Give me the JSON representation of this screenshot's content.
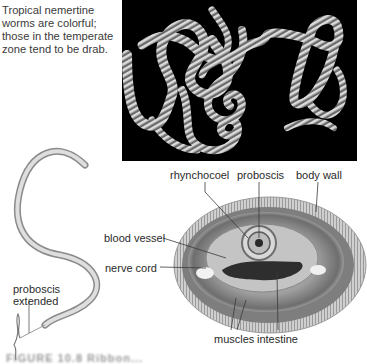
{
  "caption_top": "Tropical nemertine worms are colorful; those in the temperate zone tend to be drab.",
  "photo": {
    "description": "striped nemertine worms coiled on black background",
    "background": "#000000",
    "stripe_light": "#d8d8d8",
    "stripe_dark": "#6a6a6a"
  },
  "worm_drawing": {
    "labels": {
      "proboscis_extended": [
        "proboscis",
        "extended"
      ]
    }
  },
  "cross_section": {
    "labels": {
      "rhynchocoel": "rhynchocoel",
      "proboscis": "proboscis",
      "body_wall": "body wall",
      "blood_vessel": "blood vessel",
      "nerve_cord": "nerve cord",
      "muscles": "muscles",
      "intestine": "intestine"
    }
  },
  "figure_caption": "FIGURE 10.8 Ribbon..."
}
